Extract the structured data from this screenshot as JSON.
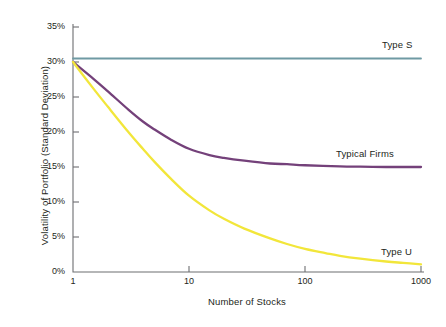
{
  "chart_data": {
    "type": "line",
    "title": "",
    "xlabel": "Number of Stocks",
    "ylabel": "Volatility of Portfolio (Standard Deviation)",
    "xscale": "log",
    "xlim": [
      1,
      1000
    ],
    "ylim": [
      0,
      35
    ],
    "grid": false,
    "legend_position": "inline-right-of-curve",
    "x_tick_labels": [
      "1",
      "10",
      "100",
      "1000"
    ],
    "x_tick_values": [
      1,
      10,
      100,
      1000
    ],
    "y_tick_labels": [
      "0%",
      "5%",
      "10%",
      "15%",
      "20%",
      "25%",
      "30%",
      "35%"
    ],
    "y_tick_values": [
      0,
      5,
      10,
      15,
      20,
      25,
      30,
      35
    ],
    "series": [
      {
        "name": "Type S",
        "color": "#6f9aa3",
        "label_x": 1000,
        "label_y": 32.5,
        "x": [
          1,
          2,
          3,
          5,
          10,
          20,
          50,
          100,
          200,
          500,
          1000
        ],
        "values": [
          30.5,
          30.5,
          30.5,
          30.5,
          30.5,
          30.5,
          30.5,
          30.5,
          30.5,
          30.5,
          30.5
        ]
      },
      {
        "name": "Typical Firms",
        "color": "#74417a",
        "label_x": 400,
        "label_y": 17.2,
        "x": [
          1,
          1.5,
          2,
          3,
          4,
          5,
          7,
          10,
          15,
          20,
          30,
          50,
          70,
          100,
          200,
          300,
          500,
          700,
          1000
        ],
        "values": [
          30.0,
          27.6,
          25.8,
          23.2,
          21.5,
          20.4,
          18.9,
          17.6,
          16.7,
          16.3,
          15.9,
          15.5,
          15.4,
          15.25,
          15.1,
          15.05,
          15.0,
          15.0,
          15.0
        ]
      },
      {
        "name": "Type U",
        "color": "#f2e63a",
        "label_x": 620,
        "label_y": 3.4,
        "x": [
          1,
          1.5,
          2,
          3,
          4,
          5,
          7,
          10,
          15,
          20,
          30,
          50,
          70,
          100,
          150,
          200,
          300,
          500,
          700,
          1000
        ],
        "values": [
          30.0,
          26.2,
          23.6,
          20.0,
          17.6,
          15.8,
          13.3,
          10.9,
          8.8,
          7.6,
          6.2,
          4.8,
          4.0,
          3.3,
          2.7,
          2.3,
          1.9,
          1.5,
          1.3,
          1.1
        ]
      }
    ]
  },
  "axis": {
    "x_title": "Number of Stocks",
    "y_title": "Volatility of Portfolio (Standard Deviation)"
  },
  "y_ticks": [
    {
      "label": "35%"
    },
    {
      "label": "30%"
    },
    {
      "label": "25%"
    },
    {
      "label": "20%"
    },
    {
      "label": "15%"
    },
    {
      "label": "10%"
    },
    {
      "label": "5%"
    },
    {
      "label": "0%"
    }
  ],
  "x_ticks": [
    {
      "label": "1"
    },
    {
      "label": "10"
    },
    {
      "label": "100"
    },
    {
      "label": "1000"
    }
  ],
  "series_labels": [
    {
      "name": "Type S"
    },
    {
      "name": "Typical Firms"
    },
    {
      "name": "Type U"
    }
  ],
  "colors": {
    "type_s": "#6f9aa3",
    "typical_firms": "#74417a",
    "type_u": "#f2e63a",
    "axis": "#6d6e71",
    "text": "#231f20",
    "background": "#ffffff"
  }
}
